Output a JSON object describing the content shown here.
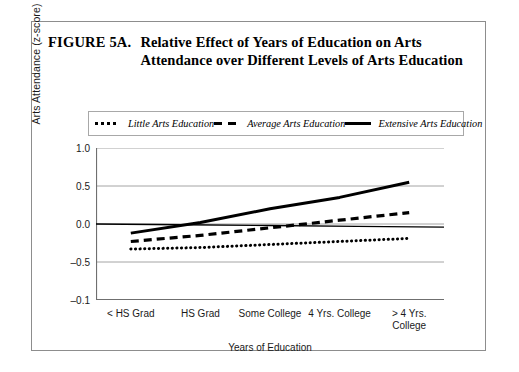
{
  "figure": {
    "label": "FIGURE 5A.",
    "title": "Relative Effect of Years of Education on Arts Attendance over Different Levels of Arts Education"
  },
  "chart_data": {
    "type": "line",
    "title": "Relative Effect of Years of Education on Arts Attendance over Different Levels of Arts Education",
    "xlabel": "Years of Education",
    "ylabel": "Arts Attendance (z-score)",
    "categories": [
      "< HS Grad",
      "HS Grad",
      "Some College",
      "4 Yrs. College",
      "> 4 Yrs.\nCollege"
    ],
    "ytick_labels": [
      "1.0",
      "0.5",
      "0.0",
      "-0.5",
      "-0.1"
    ],
    "ytick_values": [
      1.0,
      0.5,
      0.0,
      -0.5,
      -1.0
    ],
    "ylim": [
      -1.0,
      1.0
    ],
    "grid": true,
    "legend_position": "above-plot",
    "series": [
      {
        "name": "Little Arts Education",
        "style": "dotted",
        "color": "#000000",
        "values": [
          -0.33,
          -0.31,
          -0.27,
          -0.23,
          -0.19
        ]
      },
      {
        "name": "Average Arts Education",
        "style": "dashed",
        "color": "#000000",
        "values": [
          -0.23,
          -0.15,
          -0.05,
          0.05,
          0.15
        ]
      },
      {
        "name": "Extensive Arts Education",
        "style": "solid",
        "color": "#000000",
        "values": [
          -0.12,
          0.02,
          0.2,
          0.35,
          0.55
        ]
      },
      {
        "name": "Zero reference line",
        "style": "thin-solid",
        "color": "#000000",
        "values": [
          0.0,
          -0.01,
          -0.02,
          -0.03,
          -0.04
        ]
      }
    ]
  },
  "legend": [
    {
      "label": "Little Arts Education",
      "marker": "dotted-line-swatch"
    },
    {
      "label": "Average Arts Education",
      "marker": "dashed-line-swatch"
    },
    {
      "label": "Extensive Arts Education",
      "marker": "solid-line-swatch"
    }
  ]
}
